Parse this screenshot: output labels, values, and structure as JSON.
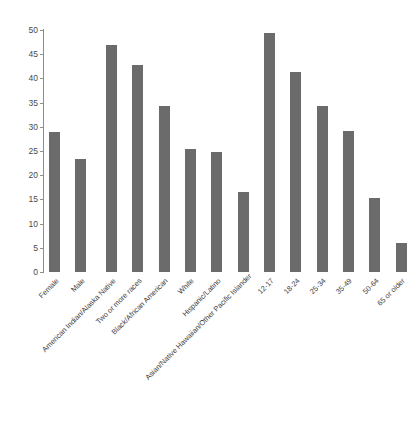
{
  "chart_data": {
    "type": "bar",
    "title": "",
    "subtitle": "",
    "xlabel": "",
    "ylabel": "",
    "ylim": [
      0,
      50
    ],
    "yticks": [
      0,
      5,
      10,
      15,
      20,
      25,
      30,
      35,
      40,
      45,
      50
    ],
    "grid": false,
    "legend": "none",
    "bar_color": "#6b6b6b",
    "axis_color": "#8c8c8c",
    "text_color": "#3d3d3d",
    "groups": [
      {
        "name": "Sex",
        "categories": [
          "Female",
          "Male"
        ],
        "values": [
          29.0,
          23.3
        ]
      },
      {
        "name": "Race/Ethnicity",
        "categories": [
          "American Indian/Alaska Native",
          "Two or more races",
          "Black/African American",
          "White",
          "Hispanic/Latino",
          "Asian/Native Hawaiian/Other Pacific Islander"
        ],
        "values": [
          47.0,
          42.8,
          34.2,
          25.4,
          24.8,
          16.5
        ]
      },
      {
        "name": "Age",
        "categories": [
          "12-17",
          "18-24",
          "25-34",
          "35-49",
          "50-64",
          "65 or older"
        ],
        "values": [
          49.4,
          41.4,
          34.4,
          29.1,
          15.3,
          6.0
        ]
      }
    ],
    "categories": [
      "Female",
      "Male",
      "American Indian/Alaska Native",
      "Two or more races",
      "Black/African American",
      "White",
      "Hispanic/Latino",
      "Asian/Native Hawaiian/Other Pacific Islander",
      "12-17",
      "18-24",
      "25-34",
      "35-49",
      "50-64",
      "65 or older"
    ],
    "values": [
      29.0,
      23.3,
      47.0,
      42.8,
      34.2,
      25.4,
      24.8,
      16.5,
      49.4,
      41.4,
      34.4,
      29.1,
      15.3,
      6.0
    ]
  }
}
